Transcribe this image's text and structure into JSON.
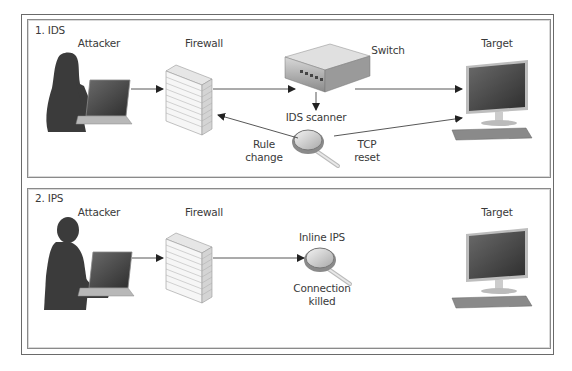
{
  "panels": [
    {
      "title": "1. IDS",
      "labels": {
        "attacker": "Attacker",
        "firewall": "Firewall",
        "switch": "Switch",
        "target": "Target",
        "scanner": "IDS scanner",
        "rule_change_1": "Rule",
        "rule_change_2": "change",
        "tcp_reset_1": "TCP",
        "tcp_reset_2": "reset"
      }
    },
    {
      "title": "2. IPS",
      "labels": {
        "attacker": "Attacker",
        "firewall": "Firewall",
        "inline_ips": "Inline IPS",
        "target": "Target",
        "connection_killed_1": "Connection",
        "connection_killed_2": "killed"
      }
    }
  ],
  "icons": [
    "attacker-female-laptop-icon",
    "firewall-brick-wall-icon",
    "network-switch-icon",
    "magnifying-glass-icon",
    "desktop-computer-icon",
    "attacker-male-laptop-icon"
  ],
  "colors": {
    "border": "#6a6a6a",
    "line": "#444444",
    "silhouette": "#3a3a3a",
    "brick": "#f2f2f2"
  }
}
